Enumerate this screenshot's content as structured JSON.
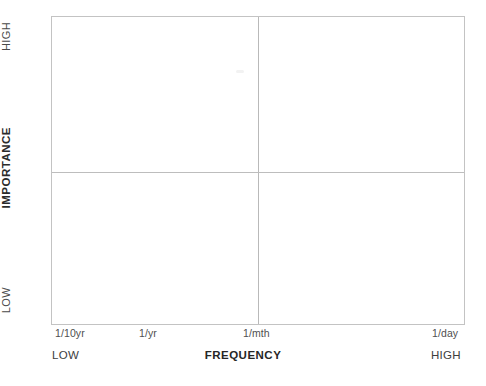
{
  "chart_data": {
    "type": "scatter",
    "title": "",
    "subtitle": "",
    "xlabel": "FREQUENCY",
    "ylabel": "IMPORTANCE",
    "x_ticks": [
      "1/10yr",
      "1/yr",
      "1/mth",
      "1/day"
    ],
    "x_axis_low_label": "LOW",
    "x_axis_high_label": "HIGH",
    "y_axis_low_label": "LOW",
    "y_axis_high_label": "HIGH",
    "grid": false,
    "legend": null,
    "series": [],
    "points": [],
    "quadrant_divider_x": "1/mth",
    "quadrant_divider_y": "mid",
    "border_color": "#c3c3c3",
    "divider_color": "#bdbdbd",
    "background_color": "#ffffff",
    "text_color": "#3b3b3b"
  },
  "axes": {
    "y": {
      "high": "HIGH",
      "title": "IMPORTANCE",
      "low": "LOW"
    },
    "x": {
      "ticks": [
        {
          "label": "1/10yr"
        },
        {
          "label": "1/yr"
        },
        {
          "label": "1/mth"
        },
        {
          "label": "1/day"
        }
      ],
      "low": "LOW",
      "title": "FREQUENCY",
      "high": "HIGH"
    }
  }
}
